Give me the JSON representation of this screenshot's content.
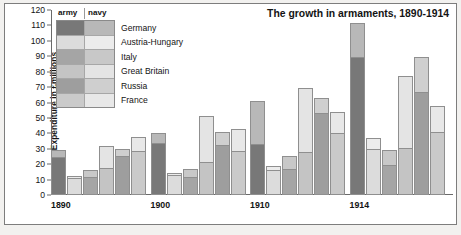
{
  "chart_data": {
    "type": "bar",
    "subtype": "grouped-stacked",
    "title": "The growth in armaments, 1890-1914",
    "xlabel": "",
    "ylabel": "Expenditure in £millions",
    "ylim": [
      0,
      120
    ],
    "ytick_step": 10,
    "yticks": [
      120,
      110,
      100,
      90,
      80,
      70,
      60,
      50,
      40,
      30,
      20,
      10,
      0
    ],
    "grid": false,
    "legend_position": "top-left",
    "legend_headers": [
      "army",
      "navy"
    ],
    "categories": [
      "1890",
      "1900",
      "1910",
      "1914"
    ],
    "countries": [
      "Germany",
      "Austria-Hungary",
      "Italy",
      "Great Britain",
      "Russia",
      "France"
    ],
    "stack_order": [
      "army",
      "navy"
    ],
    "series": [
      {
        "name": "Germany",
        "army": [
          24.5,
          34.0,
          32.8,
          89.5
        ],
        "navy": [
          4.5,
          6.5,
          28.2,
          22.0
        ],
        "totals": [
          29.0,
          40.5,
          61.0,
          111.5
        ]
      },
      {
        "name": "Austria-Hungary",
        "army": [
          11.0,
          13.0,
          16.0,
          30.0
        ],
        "navy": [
          1.5,
          1.5,
          3.0,
          7.0
        ],
        "totals": [
          12.5,
          14.5,
          19.0,
          37.0
        ]
      },
      {
        "name": "Italy",
        "army": [
          11.5,
          11.5,
          17.0,
          19.5
        ],
        "navy": [
          5.0,
          5.5,
          8.2,
          10.0
        ],
        "totals": [
          16.5,
          17.0,
          25.2,
          29.5
        ]
      },
      {
        "name": "Great Britain",
        "army": [
          17.5,
          21.5,
          28.2,
          30.5
        ],
        "navy": [
          14.0,
          29.5,
          41.0,
          46.5
        ],
        "totals": [
          31.5,
          51.0,
          69.2,
          77.0
        ]
      },
      {
        "name": "Russia",
        "army": [
          25.0,
          32.5,
          53.5,
          66.5
        ],
        "navy": [
          5.0,
          8.2,
          9.5,
          23.0
        ],
        "totals": [
          30.0,
          40.7,
          63.0,
          89.5
        ]
      },
      {
        "name": "France",
        "army": [
          28.5,
          28.8,
          40.0,
          41.0
        ],
        "navy": [
          9.0,
          14.2,
          14.0,
          17.0
        ],
        "totals": [
          37.5,
          43.0,
          54.0,
          58.0
        ]
      }
    ],
    "colors": {
      "Germany": {
        "army": "#787878",
        "navy": "#b8b8b8"
      },
      "Austria-Hungary": {
        "army": "#dcdcdc",
        "navy": "#ececec"
      },
      "Italy": {
        "army": "#a5a5a5",
        "navy": "#c8c8c8"
      },
      "Great Britain": {
        "army": "#c4c4c4",
        "navy": "#e4e4e4"
      },
      "Russia": {
        "army": "#9e9e9e",
        "navy": "#cfcfcf"
      },
      "France": {
        "army": "#cacaca",
        "navy": "#e8e8e8"
      }
    }
  }
}
